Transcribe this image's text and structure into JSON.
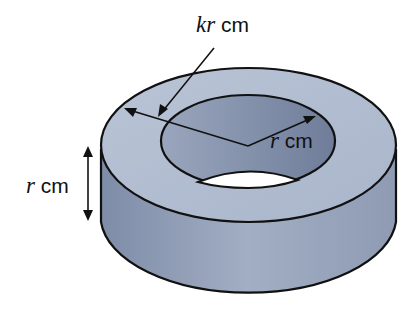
{
  "diagram": {
    "type": "hollow-cylinder",
    "labels": {
      "outer_radius": {
        "var": "kr",
        "unit": "cm"
      },
      "inner_radius": {
        "var": "r",
        "unit": "cm"
      },
      "height": {
        "var": "r",
        "unit": "cm"
      }
    },
    "colors": {
      "fill_top": "#b3bfd2",
      "fill_side": "#8a97b0",
      "fill_inner": "#8693ac",
      "outline": "#111111"
    }
  }
}
